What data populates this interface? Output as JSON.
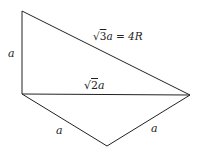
{
  "diagram": {
    "vertices": {
      "top": [
        22,
        11
      ],
      "left": [
        22,
        94
      ],
      "right": [
        190,
        95
      ],
      "bottom": [
        107,
        146
      ]
    },
    "edges": [
      {
        "from": "top",
        "to": "left",
        "label": "a"
      },
      {
        "from": "top",
        "to": "right",
        "label": "√3a = 4R"
      },
      {
        "from": "left",
        "to": "right",
        "label": "√2a"
      },
      {
        "from": "left",
        "to": "bottom",
        "label": "a"
      },
      {
        "from": "bottom",
        "to": "right",
        "label": "a"
      }
    ],
    "labels": {
      "left_side": "a",
      "hypotenuse_sqrt": "√",
      "hypotenuse_rad": "3",
      "hypotenuse_rest": "a = 4R",
      "middle_sqrt": "√",
      "middle_rad": "2",
      "middle_rest": "a",
      "bottom_left": "a",
      "bottom_right": "a"
    },
    "stroke_color": "#222222"
  }
}
